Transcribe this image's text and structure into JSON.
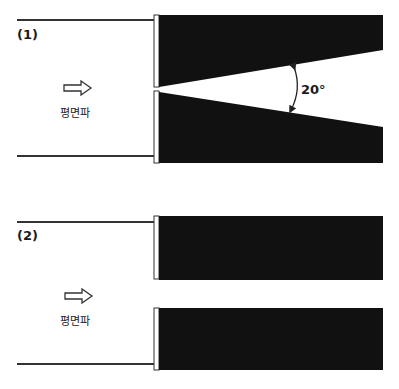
{
  "diagrams": [
    {
      "label": "(1)",
      "wave_label": "평면파",
      "angle_label": "20°",
      "description": "Plane wave incident on a tapered (wedge-shaped) slit opening with 20° angle"
    },
    {
      "label": "(2)",
      "wave_label": "평면파",
      "description": "Plane wave incident on a straight parallel slit opening"
    }
  ],
  "colors": {
    "block": "#111111",
    "line": "#333333",
    "background": "#ffffff"
  }
}
